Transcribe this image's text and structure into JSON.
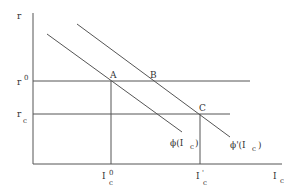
{
  "diagram": {
    "y_axis_label": "r",
    "x_axis_label": {
      "main": "I",
      "sub": "c"
    },
    "levels": {
      "r0": {
        "main": "r",
        "sup": "0"
      },
      "rc": {
        "main": "r",
        "sub": "c"
      }
    },
    "x_ticks": {
      "ic0": {
        "main": "I",
        "sub": "c",
        "sup": "0"
      },
      "icprime": {
        "main": "I",
        "prime": "'",
        "sub": "c"
      }
    },
    "points": {
      "A": "A",
      "B": "B",
      "C": "C"
    },
    "curves": {
      "phi": {
        "label": "ϕ(I",
        "sub": "c",
        "close": ")"
      },
      "phi_prime": {
        "label": "ϕ'(I",
        "sub": "c",
        "close": ")"
      }
    },
    "colors": {
      "line": "#555555",
      "text": "#333333",
      "background": "#ffffff"
    }
  }
}
